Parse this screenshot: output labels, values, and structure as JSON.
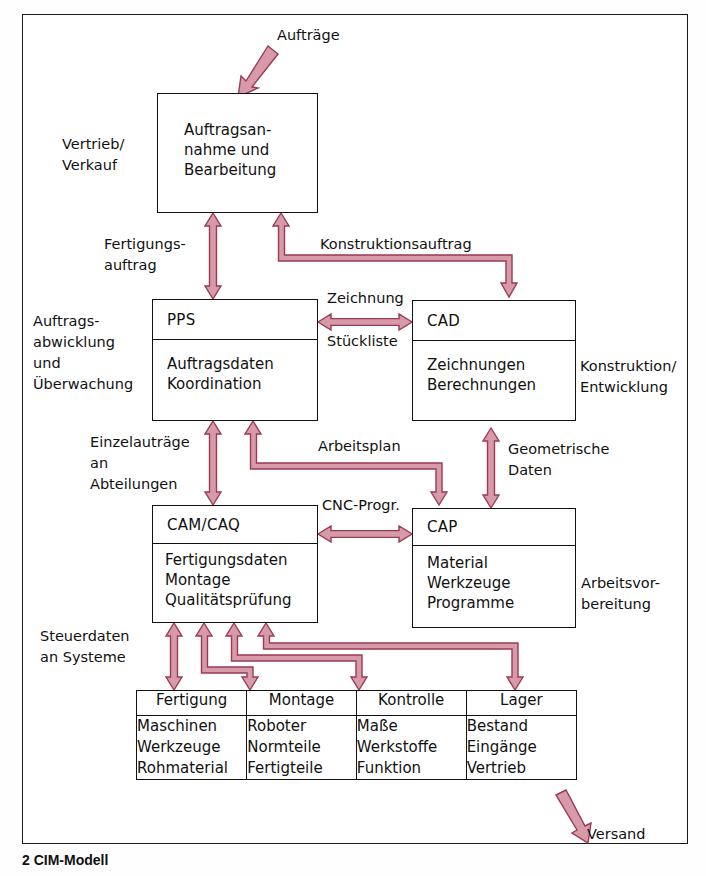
{
  "figure": {
    "caption": "2 CIM-Modell",
    "arrow_color": "#d79aa8",
    "arrow_stroke": "#9b3a52",
    "line_color": "#111111"
  },
  "boxes": {
    "order_entry": {
      "lines": [
        "Auftragsan-",
        "nahme und",
        "Bearbeitung"
      ]
    },
    "pps": {
      "title": "PPS",
      "lines": [
        "Auftragsdaten",
        "Koordination"
      ]
    },
    "cad": {
      "title": "CAD",
      "lines": [
        "Zeichnungen",
        "Berechnungen"
      ]
    },
    "cam_caq": {
      "title": "CAM/CAQ",
      "lines": [
        "Fertigungsdaten",
        "Montage",
        "Qualitätsprüfung"
      ]
    },
    "cap": {
      "title": "CAP",
      "lines": [
        "Material",
        "Werkzeuge",
        "Programme"
      ]
    }
  },
  "side_labels": {
    "left_sales": "Vertrieb/\nVerkauf",
    "left_order_processing": "Auftrags-\nabwicklung\nund\nÜberwachung",
    "left_control_data": "Steuerdaten\nan Systeme",
    "right_design": "Konstruktion/\nEntwicklung",
    "right_work_prep": "Arbeitsvor-\nbereitung"
  },
  "flow_labels": {
    "auftraege": "Aufträge",
    "fertigungsauftrag": "Fertigungs-\nauftrag",
    "konstruktionsauftrag": "Konstruktionsauftrag",
    "zeichnung": "Zeichnung",
    "stueckliste": "Stückliste",
    "einzelauftraege": "Einzelauträge\nan\nAbteilungen",
    "arbeitsplan": "Arbeitsplan",
    "geometrische_daten": "Geometrische\nDaten",
    "cnc_progr": "CNC-Progr.",
    "versand": "Versand"
  },
  "shopfloor_table": {
    "headers": [
      "Fertigung",
      "Montage",
      "Kontrolle",
      "Lager"
    ],
    "columns": [
      [
        "Maschinen",
        "Werkzeuge",
        "Rohmaterial"
      ],
      [
        "Roboter",
        "Normteile",
        "Fertigteile"
      ],
      [
        "Maße",
        "Werkstoffe",
        "Funktion"
      ],
      [
        "Bestand",
        "Eingänge",
        "Vertrieb"
      ]
    ]
  }
}
